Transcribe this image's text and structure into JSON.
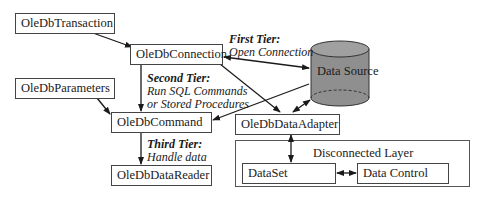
{
  "diagram": {
    "nodes": {
      "transaction": "OleDbTransaction",
      "connection": "OleDbConnection",
      "parameters": "OleDbParameters",
      "command": "OleDbCommand",
      "data_reader": "OleDbDataReader",
      "data_adapter": "OleDbDataAdapter",
      "data_source": "Data Source",
      "dataset": "DataSet",
      "data_control": "Data Control"
    },
    "disconnected_layer": "Disconnected Layer",
    "tiers": {
      "first": {
        "title": "First Tier:",
        "desc": "Open Connection"
      },
      "second": {
        "title": "Second Tier:",
        "desc_line1": "Run SQL Commands",
        "desc_line2": "or Stored Procedures"
      },
      "third": {
        "title": "Third Tier:",
        "desc": "Handle data"
      }
    },
    "colors": {
      "cylinder": "#8f8f8f",
      "cylinder_top": "#9c9c9c",
      "border": "#444444"
    }
  }
}
